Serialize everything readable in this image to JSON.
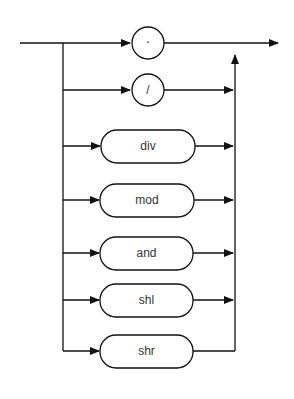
{
  "diagram": {
    "type": "syntax-diagram",
    "alternatives": [
      {
        "shape": "circle",
        "label": "·"
      },
      {
        "shape": "circle",
        "label": "/"
      },
      {
        "shape": "rounded-box",
        "label": "div"
      },
      {
        "shape": "rounded-box",
        "label": "mod"
      },
      {
        "shape": "rounded-box",
        "label": "and"
      },
      {
        "shape": "rounded-box",
        "label": "shl"
      },
      {
        "shape": "rounded-box",
        "label": "shr"
      }
    ],
    "colors": {
      "stroke": "#111111",
      "text": "#333333",
      "background": "#ffffff"
    }
  }
}
